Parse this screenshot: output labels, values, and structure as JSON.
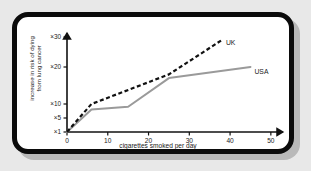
{
  "chart_data": {
    "type": "line",
    "title": "",
    "xlabel": "cigarettes smoked per day",
    "ylabel": "increase in risk of dying from lung cancer",
    "ylabel_line1": "increase in risk of dying",
    "ylabel_line2": "from lung cancer",
    "xlim": [
      0,
      52
    ],
    "ylim": [
      1,
      32
    ],
    "xticks": [
      "0",
      "10",
      "20",
      "30",
      "40",
      "50"
    ],
    "xtick_values": [
      0,
      10,
      20,
      30,
      40,
      50
    ],
    "yticks": [
      "×1",
      "×5",
      "×10",
      "×20",
      "×30"
    ],
    "ytick_values": [
      1,
      5,
      10,
      20,
      30
    ],
    "grid": false,
    "legend_position": "inline-end-of-line",
    "series": [
      {
        "name": "UK",
        "style": "dashed",
        "color": "#111111",
        "x": [
          0,
          6,
          25,
          38
        ],
        "y": [
          1,
          10,
          18,
          29
        ]
      },
      {
        "name": "USA",
        "style": "solid",
        "color": "#9a9a9a",
        "x": [
          0,
          6,
          15,
          25,
          45
        ],
        "y": [
          1,
          8,
          9,
          17,
          20
        ]
      }
    ]
  },
  "figure": {
    "frame_color": "#0b0b0b",
    "background_color": "#e8e8e8",
    "plot_background": "#ffffff",
    "shadow_color": "#b9b9b9"
  }
}
